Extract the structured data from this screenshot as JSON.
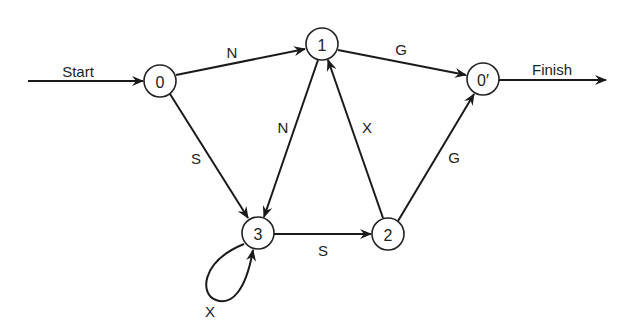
{
  "diagram": {
    "type": "state-transition-graph",
    "nodes": [
      {
        "id": "0",
        "label": "0",
        "x": 160,
        "y": 80
      },
      {
        "id": "1",
        "label": "1",
        "x": 322,
        "y": 44
      },
      {
        "id": "0p",
        "label": "0′",
        "x": 483,
        "y": 79
      },
      {
        "id": "3",
        "label": "3",
        "x": 258,
        "y": 233
      },
      {
        "id": "2",
        "label": "2",
        "x": 388,
        "y": 234
      }
    ],
    "edges": [
      {
        "from": "start",
        "to": "0",
        "label": "Start"
      },
      {
        "from": "0",
        "to": "1",
        "label": "N"
      },
      {
        "from": "0",
        "to": "3",
        "label": "S"
      },
      {
        "from": "1",
        "to": "3",
        "label": "N"
      },
      {
        "from": "1",
        "to": "0p",
        "label": "G"
      },
      {
        "from": "2",
        "to": "1",
        "label": "X"
      },
      {
        "from": "3",
        "to": "2",
        "label": "S"
      },
      {
        "from": "3",
        "to": "3",
        "label": "X"
      },
      {
        "from": "2",
        "to": "0p",
        "label": "G"
      },
      {
        "from": "0p",
        "to": "finish",
        "label": "Finish"
      }
    ],
    "labels": {
      "start": "Start",
      "finish": "Finish",
      "e_0_1": "N",
      "e_0_3": "S",
      "e_1_3": "N",
      "e_1_0p": "G",
      "e_2_1": "X",
      "e_3_2": "S",
      "e_3_3": "X",
      "e_2_0p": "G"
    },
    "node_labels": {
      "n0": "0",
      "n1": "1",
      "n0p": "0′",
      "n3": "3",
      "n2": "2"
    }
  }
}
